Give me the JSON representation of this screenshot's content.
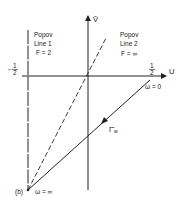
{
  "figure": {
    "panel_label": "(b)",
    "axes": {
      "horizontal_label": "U",
      "vertical_label": "V̂",
      "left_tick": {
        "sign": "−",
        "num": "1",
        "den": "2"
      },
      "right_tick": {
        "num": "1",
        "den": "2"
      }
    },
    "popov_line_1": {
      "title": "Popov",
      "subtitle": "Line 1",
      "param": "F = 2"
    },
    "popov_line_2": {
      "title": "Popov",
      "subtitle": "Line 2",
      "param": "F = ∞"
    },
    "locus": {
      "label_main": "Γ̂",
      "label_sub": "w",
      "start_label": "ω = 0",
      "end_label": "ω = ∞"
    },
    "colors": {
      "stroke": "#222222",
      "background": "#ffffff"
    }
  }
}
